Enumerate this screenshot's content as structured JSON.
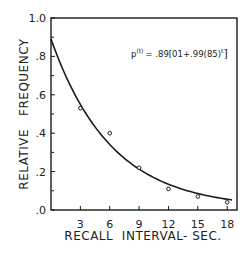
{
  "chart_data": {
    "type": "scatter",
    "title": "",
    "xlabel": "RECALL  INTERVAL- SEC.",
    "ylabel": "RELATIVE   FREQUENCY",
    "xlim": [
      0,
      19
    ],
    "ylim": [
      0,
      1.0
    ],
    "x_ticks": [
      3,
      6,
      9,
      12,
      15,
      18
    ],
    "x_tick_labels": [
      "3",
      "6",
      "9",
      "12",
      "15",
      "18"
    ],
    "y_ticks": [
      0,
      0.2,
      0.4,
      0.6,
      0.8,
      1.0
    ],
    "y_tick_labels": [
      ".0",
      ".2",
      ".4",
      ".6",
      ".8",
      "1.0"
    ],
    "grid": false,
    "legend": null,
    "series": [
      {
        "name": "Observed",
        "kind": "points",
        "x": [
          3,
          6,
          9,
          12,
          15,
          18
        ],
        "y": [
          0.53,
          0.4,
          0.22,
          0.11,
          0.07,
          0.04
        ]
      },
      {
        "name": "Fitted curve",
        "kind": "line",
        "formula": "p(t) = .89[.01 + .99(.85)^t]"
      }
    ],
    "annotations": [
      {
        "text": "p(t) = .89[.01+.99(.85)t]",
        "position": "upper-right"
      }
    ]
  },
  "formula": {
    "p": "p",
    "sup_t": "(t)",
    "eq": "= .89[01+.99(85)",
    "sup_t2": "t",
    "close": "]"
  }
}
